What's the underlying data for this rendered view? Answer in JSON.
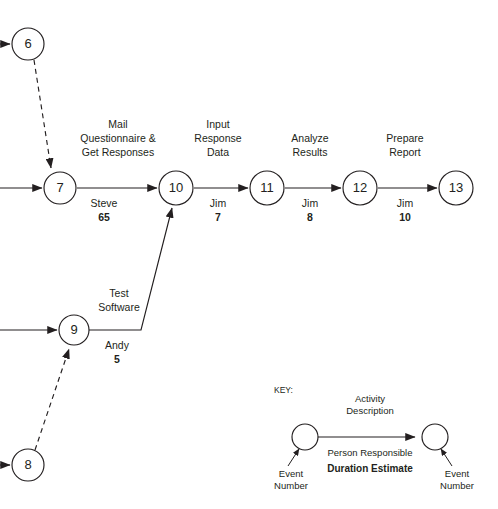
{
  "diagram": {
    "type": "project-network-diagram",
    "colors": {
      "stroke": "#231f20",
      "background": "#ffffff"
    },
    "nodes": [
      {
        "id": "6",
        "label": "6",
        "cx": 28,
        "cy": 44,
        "r": 16
      },
      {
        "id": "7",
        "label": "7",
        "cx": 60,
        "cy": 188,
        "r": 16
      },
      {
        "id": "8",
        "label": "8",
        "cx": 28,
        "cy": 465,
        "r": 16
      },
      {
        "id": "9",
        "label": "9",
        "cx": 74,
        "cy": 330,
        "r": 15
      },
      {
        "id": "10",
        "label": "10",
        "cx": 176,
        "cy": 188,
        "r": 17
      },
      {
        "id": "11",
        "label": "11",
        "cx": 267,
        "cy": 188,
        "r": 17
      },
      {
        "id": "12",
        "label": "12",
        "cx": 360,
        "cy": 188,
        "r": 17
      },
      {
        "id": "13",
        "label": "13",
        "cx": 456,
        "cy": 188,
        "r": 17
      }
    ],
    "activities": [
      {
        "from": "7",
        "to": "10",
        "description_lines": [
          "Mail",
          "Questionnaire &",
          "Get Responses"
        ],
        "person": "Steve",
        "duration": "65",
        "style": "solid"
      },
      {
        "from": "10",
        "to": "11",
        "description_lines": [
          "Input",
          "Response",
          "Data"
        ],
        "person": "Jim",
        "duration": "7",
        "style": "solid"
      },
      {
        "from": "11",
        "to": "12",
        "description_lines": [
          "Analyze",
          "Results"
        ],
        "person": "Jim",
        "duration": "8",
        "style": "solid"
      },
      {
        "from": "12",
        "to": "13",
        "description_lines": [
          "Prepare",
          "Report"
        ],
        "person": "Jim",
        "duration": "10",
        "style": "solid"
      },
      {
        "from": "9",
        "to": "10",
        "description_lines": [
          "Test",
          "Software"
        ],
        "person": "Andy",
        "duration": "5",
        "style": "solid"
      },
      {
        "from": "6",
        "to": "7",
        "description_lines": [],
        "person": "",
        "duration": "",
        "style": "dashed"
      },
      {
        "from": "8",
        "to": "9",
        "description_lines": [],
        "person": "",
        "duration": "",
        "style": "dashed"
      }
    ],
    "labels": {
      "mail_line1": "Mail",
      "mail_line2": "Questionnaire &",
      "mail_line3": "Get Responses",
      "mail_person": "Steve",
      "mail_duration": "65",
      "input_line1": "Input",
      "input_line2": "Response",
      "input_line3": "Data",
      "input_person": "Jim",
      "input_duration": "7",
      "analyze_line1": "Analyze",
      "analyze_line2": "Results",
      "analyze_person": "Jim",
      "analyze_duration": "8",
      "prepare_line1": "Prepare",
      "prepare_line2": "Report",
      "prepare_person": "Jim",
      "prepare_duration": "10",
      "test_line1": "Test",
      "test_line2": "Software",
      "test_person": "Andy",
      "test_duration": "5"
    },
    "node_labels": {
      "n6": "6",
      "n7": "7",
      "n8": "8",
      "n9": "9",
      "n10": "10",
      "n11": "11",
      "n12": "12",
      "n13": "13"
    },
    "key": {
      "title": "KEY:",
      "activity_line1": "Activity",
      "activity_line2": "Description",
      "person_responsible": "Person Responsible",
      "duration_estimate": "Duration Estimate",
      "event_number_left_line1": "Event",
      "event_number_left_line2": "Number",
      "event_number_right_line1": "Event",
      "event_number_right_line2": "Number"
    }
  }
}
